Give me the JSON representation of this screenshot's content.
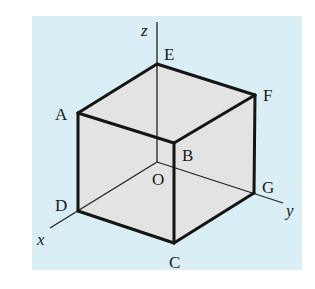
{
  "colors": {
    "background_panel": "#d9eef5",
    "cube_face": "#e3e3e3",
    "edge": "#141414",
    "axis": "#222222"
  },
  "axes": {
    "x": {
      "label": "x"
    },
    "y": {
      "label": "y"
    },
    "z": {
      "label": "z"
    }
  },
  "vertices": {
    "A": {
      "label": "A"
    },
    "B": {
      "label": "B"
    },
    "C": {
      "label": "C"
    },
    "D": {
      "label": "D"
    },
    "E": {
      "label": "E"
    },
    "F": {
      "label": "F"
    },
    "G": {
      "label": "G"
    },
    "O": {
      "label": "O"
    }
  }
}
